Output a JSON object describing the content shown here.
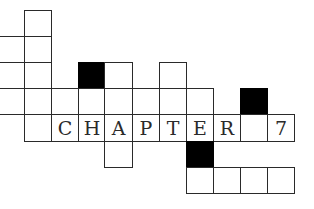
{
  "puzzle": {
    "type": "crossword-grid",
    "title_word": "CHAPTER 7",
    "colors": {
      "line": "#2a2a2a",
      "fill": "#ffffff",
      "block": "#000000"
    },
    "cells": [
      {
        "r": 0,
        "c": 0,
        "letter": "",
        "black": false
      },
      {
        "r": 1,
        "c": 0,
        "letter": "",
        "black": false
      },
      {
        "r": 2,
        "c": 0,
        "letter": "",
        "black": false
      },
      {
        "r": 2,
        "c": 2,
        "letter": "",
        "black": true
      },
      {
        "r": 2,
        "c": 3,
        "letter": "",
        "black": false
      },
      {
        "r": 2,
        "c": 5,
        "letter": "",
        "black": false
      },
      {
        "r": 3,
        "c": 0,
        "letter": "",
        "black": false
      },
      {
        "r": 3,
        "c": 1,
        "letter": "",
        "black": false
      },
      {
        "r": 3,
        "c": 2,
        "letter": "",
        "black": false
      },
      {
        "r": 3,
        "c": 3,
        "letter": "",
        "black": false
      },
      {
        "r": 3,
        "c": 4,
        "letter": "",
        "black": false
      },
      {
        "r": 3,
        "c": 5,
        "letter": "",
        "black": false
      },
      {
        "r": 3,
        "c": 6,
        "letter": "",
        "black": false
      },
      {
        "r": 3,
        "c": 8,
        "letter": "",
        "black": true
      },
      {
        "r": 4,
        "c": 0,
        "letter": "",
        "black": false
      },
      {
        "r": 4,
        "c": 1,
        "letter": "C",
        "black": false
      },
      {
        "r": 4,
        "c": 2,
        "letter": "H",
        "black": false
      },
      {
        "r": 4,
        "c": 3,
        "letter": "A",
        "black": false
      },
      {
        "r": 4,
        "c": 4,
        "letter": "P",
        "black": false
      },
      {
        "r": 4,
        "c": 5,
        "letter": "T",
        "black": false
      },
      {
        "r": 4,
        "c": 6,
        "letter": "E",
        "black": false
      },
      {
        "r": 4,
        "c": 7,
        "letter": "R",
        "black": false
      },
      {
        "r": 4,
        "c": 8,
        "letter": "",
        "black": false
      },
      {
        "r": 4,
        "c": 9,
        "letter": "7",
        "black": false
      },
      {
        "r": 5,
        "c": 3,
        "letter": "",
        "black": false
      },
      {
        "r": 5,
        "c": 6,
        "letter": "",
        "black": true
      },
      {
        "r": 6,
        "c": 6,
        "letter": "",
        "black": false
      },
      {
        "r": 6,
        "c": 7,
        "letter": "",
        "black": false
      },
      {
        "r": 6,
        "c": 8,
        "letter": "",
        "black": false
      },
      {
        "r": 6,
        "c": 9,
        "letter": "",
        "black": false
      }
    ]
  }
}
